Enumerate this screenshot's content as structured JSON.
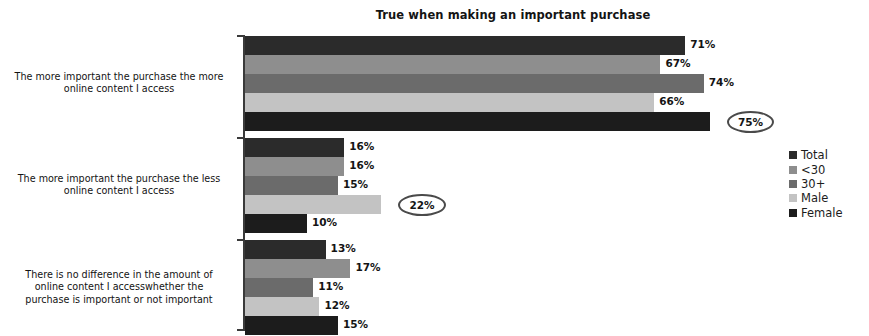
{
  "chart_data": {
    "type": "bar",
    "orientation": "horizontal",
    "title": "True when making an important purchase",
    "xlabel": "",
    "ylabel": "",
    "xlim": [
      0,
      80
    ],
    "grid": false,
    "legend_position": "right",
    "value_suffix": "%",
    "categories": [
      "The more important the purchase the more online content I access",
      "The more important the purchase the less online content I access",
      "There is no difference in the amount of online content I accesswhether the purchase is important or not important"
    ],
    "category_lines": [
      [
        "The more important the purchase the more",
        "online content I access"
      ],
      [
        "The more important the purchase the less",
        "online content I access"
      ],
      [
        "There is no difference in the amount of",
        "online content I accesswhether the",
        "purchase is important or not important"
      ]
    ],
    "series": [
      {
        "name": "Total",
        "color": "#2b2b2b",
        "values": [
          71,
          16,
          13
        ]
      },
      {
        "name": "<30",
        "color": "#8e8e8e",
        "values": [
          67,
          16,
          17
        ]
      },
      {
        "name": "30+",
        "color": "#6b6b6b",
        "values": [
          74,
          15,
          11
        ]
      },
      {
        "name": "Male",
        "color": "#c3c3c3",
        "values": [
          66,
          22,
          12
        ]
      },
      {
        "name": "Female",
        "color": "#1c1c1c",
        "values": [
          75,
          10,
          15
        ]
      }
    ],
    "labels": [
      [
        "71%",
        "67%",
        "74%",
        "66%",
        "75%"
      ],
      [
        "16%",
        "16%",
        "15%",
        "22%",
        "10%"
      ],
      [
        "13%",
        "17%",
        "11%",
        "12%",
        "15%"
      ]
    ],
    "highlighted": [
      {
        "category_index": 0,
        "series_index": 4,
        "label": "75%"
      },
      {
        "category_index": 1,
        "series_index": 3,
        "label": "22%"
      }
    ]
  },
  "legend": {
    "items": [
      {
        "label": "Total",
        "color": "#2b2b2b"
      },
      {
        "label": "<30",
        "color": "#8e8e8e"
      },
      {
        "label": "30+",
        "color": "#6b6b6b"
      },
      {
        "label": "Male",
        "color": "#c3c3c3"
      },
      {
        "label": "Female",
        "color": "#1c1c1c"
      }
    ]
  }
}
